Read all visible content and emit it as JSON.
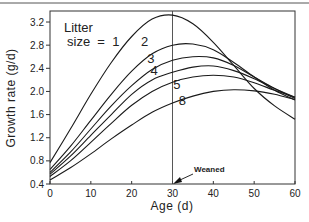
{
  "chart_data": {
    "type": "line",
    "title": "",
    "xlabel": "Age (d)",
    "ylabel": "Growth rate (g/d)",
    "xlim": [
      0,
      60
    ],
    "ylim": [
      0.4,
      3.4
    ],
    "xticks": [
      0,
      10,
      20,
      30,
      40,
      50,
      60
    ],
    "yticks": [
      0.4,
      0.8,
      1.2,
      1.6,
      2.0,
      2.4,
      2.8,
      3.2
    ],
    "ytick_labels": [
      "0.4",
      "0.8",
      "1.2",
      "1.6",
      "2.0",
      "2.4",
      "2.8",
      "3.2"
    ],
    "grid": false,
    "legend_title": [
      "Litter",
      "size  =  1"
    ],
    "annotation": {
      "text": "Weaned",
      "x": 30,
      "vertical_line_at": 30
    },
    "x": [
      0,
      5,
      10,
      15,
      20,
      25,
      30,
      35,
      40,
      45,
      50,
      55,
      60
    ],
    "series": [
      {
        "name": "1",
        "values": [
          0.77,
          1.35,
          1.95,
          2.5,
          2.95,
          3.25,
          3.32,
          3.17,
          2.85,
          2.45,
          2.05,
          1.75,
          1.52
        ]
      },
      {
        "name": "2",
        "values": [
          0.65,
          1.05,
          1.5,
          1.95,
          2.35,
          2.65,
          2.8,
          2.82,
          2.72,
          2.5,
          2.25,
          2.02,
          1.85
        ]
      },
      {
        "name": "3",
        "values": [
          0.6,
          0.95,
          1.35,
          1.75,
          2.1,
          2.38,
          2.54,
          2.6,
          2.58,
          2.45,
          2.25,
          2.05,
          1.88
        ]
      },
      {
        "name": "4",
        "values": [
          0.57,
          0.88,
          1.24,
          1.6,
          1.95,
          2.2,
          2.33,
          2.42,
          2.44,
          2.36,
          2.22,
          2.05,
          1.9
        ]
      },
      {
        "name": "5",
        "values": [
          0.53,
          0.8,
          1.12,
          1.45,
          1.76,
          2.0,
          2.16,
          2.25,
          2.28,
          2.25,
          2.15,
          2.02,
          1.9
        ]
      },
      {
        "name": "8",
        "values": [
          0.47,
          0.68,
          0.92,
          1.18,
          1.42,
          1.64,
          1.8,
          1.92,
          2.0,
          2.03,
          2.01,
          1.95,
          1.86
        ]
      }
    ],
    "curve_labels": [
      {
        "text": "2",
        "x": 22.3,
        "y": 2.78
      },
      {
        "text": "3",
        "x": 23.8,
        "y": 2.5
      },
      {
        "text": "4",
        "x": 24.6,
        "y": 2.28
      },
      {
        "text": "5",
        "x": 30.2,
        "y": 2.04
      },
      {
        "text": "8",
        "x": 31.5,
        "y": 1.76
      }
    ]
  }
}
